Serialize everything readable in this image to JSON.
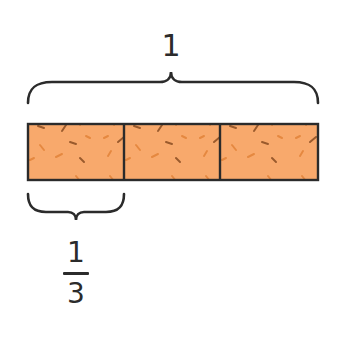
{
  "diagram": {
    "type": "fraction-bar",
    "whole_label": "1",
    "part_label": {
      "numerator": "1",
      "denominator": "3"
    },
    "parts": 3,
    "colors": {
      "fill": "#F8A96C",
      "outline": "#2b2b2b",
      "speckle_dark": "#9A5A2C",
      "speckle_light": "#E58840",
      "brace": "#2b2b2b"
    }
  }
}
